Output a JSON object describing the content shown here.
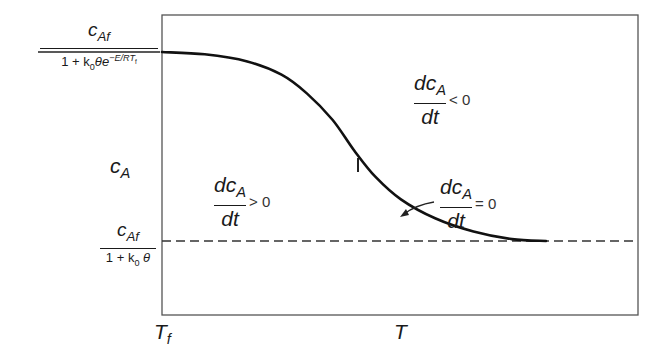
{
  "diagram": {
    "title": "",
    "curve_points_normalized": [
      [
        0.0,
        0.0
      ],
      [
        0.1,
        0.012
      ],
      [
        0.2,
        0.05
      ],
      [
        0.28,
        0.12
      ],
      [
        0.34,
        0.22
      ],
      [
        0.4,
        0.36
      ],
      [
        0.45,
        0.52
      ],
      [
        0.5,
        0.66
      ],
      [
        0.56,
        0.78
      ],
      [
        0.64,
        0.88
      ],
      [
        0.73,
        0.95
      ],
      [
        0.82,
        0.99
      ],
      [
        0.9,
        1.0
      ]
    ],
    "asymptote_style": "dashed",
    "labels": {
      "top_level": {
        "numerator": "c",
        "numerator_sub": "Af",
        "denominator_prefix": "1 + k",
        "denominator_sub": "0",
        "denominator_mid": "θe",
        "denominator_sup": "−E/RT",
        "denominator_sup_sub": "f"
      },
      "y_axis": {
        "main": "c",
        "sub": "A"
      },
      "bottom_level": {
        "numerator": "c",
        "numerator_sub": "Af",
        "denominator_prefix": "1 + k",
        "denominator_sub": "0",
        "denominator_suffix": " θ"
      },
      "x_axis_origin": {
        "main": "T",
        "sub": "f"
      },
      "x_axis": "T",
      "region_upper": {
        "num": "dc",
        "num_sub": "A",
        "den": "dt",
        "relation": "< 0"
      },
      "region_lower": {
        "num": "dc",
        "num_sub": "A",
        "den": "dt",
        "relation": "> 0"
      },
      "nullcline": {
        "num": "dc",
        "num_sub": "A",
        "den": "dt",
        "relation": "= 0"
      },
      "branch_mark": "I"
    }
  }
}
